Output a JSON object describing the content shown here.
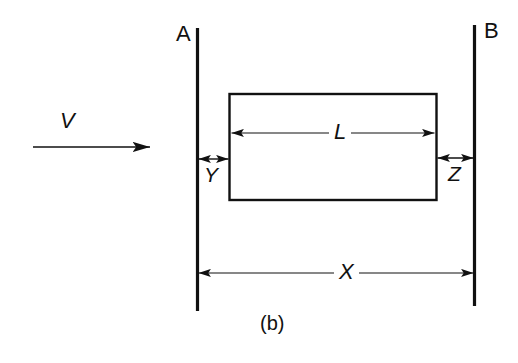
{
  "figure": {
    "caption": "(b)",
    "background_color": "#ffffff",
    "ink_color": "#111111",
    "width": 518,
    "height": 363
  },
  "walls": {
    "left": {
      "label": "A",
      "x": 197.5,
      "y_top": 28,
      "y_bottom": 311,
      "thickness": 3.2
    },
    "right": {
      "label": "B",
      "x": 474.5,
      "y_top": 25,
      "y_bottom": 306,
      "thickness": 3.2
    }
  },
  "body": {
    "name": "rectangular-block",
    "x": 229.5,
    "y": 94,
    "width": 207,
    "height": 106,
    "stroke_width": 2.4,
    "fill": "none"
  },
  "velocity_arrow": {
    "label": "V",
    "x_start": 33,
    "x_end": 165,
    "y": 147,
    "direction": "right"
  },
  "dimensions": [
    {
      "name": "gap-y",
      "label": "Y",
      "x_start": 197.5,
      "x_end": 229.5,
      "y": 159,
      "arrowheads": "both"
    },
    {
      "name": "gap-z",
      "label": "Z",
      "x_start": 436.5,
      "x_end": 474.5,
      "y": 158,
      "arrowheads": "both"
    },
    {
      "name": "body-length-l",
      "label": "L",
      "x_start": 230,
      "x_end": 436,
      "y": 133,
      "arrowheads": "both"
    },
    {
      "name": "wall-separation-x",
      "label": "X",
      "x_start": 197.5,
      "x_end": 474.5,
      "y": 273,
      "arrowheads": "both"
    }
  ]
}
